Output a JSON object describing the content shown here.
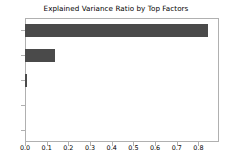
{
  "chart_data": {
    "type": "bar",
    "orientation": "horizontal",
    "title": "Explained Variance Ratio by Top Factors",
    "xlabel": "",
    "ylabel": "",
    "categories": [
      "0",
      "1",
      "2",
      "3",
      "4"
    ],
    "values": [
      0.845,
      0.14,
      0.01,
      0.0,
      0.0
    ],
    "xlim": [
      0.0,
      0.895
    ],
    "xticks": [
      "0.0",
      "0.1",
      "0.2",
      "0.3",
      "0.4",
      "0.5",
      "0.6",
      "0.7",
      "0.8"
    ],
    "xtick_values": [
      0.0,
      0.1,
      0.2,
      0.3,
      0.4,
      0.5,
      0.6,
      0.7,
      0.8
    ],
    "yticks": [
      "0",
      "1",
      "2",
      "3",
      "4"
    ],
    "grid": false,
    "legend": null,
    "bar_color": "#4a4a4a",
    "background_color": "#ffffff",
    "axis_color": "#b0b0b0"
  }
}
